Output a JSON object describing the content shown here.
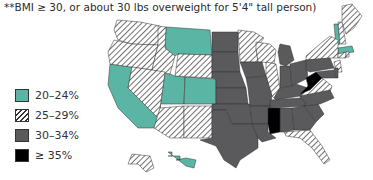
{
  "note": "**BMI ≥ 30, or about 30 lbs overweight for 5'4\" tall person)",
  "legend": [
    {
      "key": "teal",
      "label": "20–24%",
      "color": "#5bb5a5"
    },
    {
      "key": "hatch",
      "label": "25–29%",
      "color": "#ffffff"
    },
    {
      "key": "gray",
      "label": "30–34%",
      "color": "#5a5a5c"
    },
    {
      "key": "black",
      "label": "≥ 35%",
      "color": "#000000"
    }
  ],
  "colors": {
    "teal": "#5bb5a5",
    "gray": "#5a5a5c",
    "black": "#000000",
    "hatch": "#333333"
  },
  "chart_data": {
    "type": "choropleth",
    "title": "",
    "categories": [
      "20–24%",
      "25–29%",
      "30–34%",
      "≥ 35%"
    ],
    "states": {
      "teal": [
        "California",
        "Montana",
        "Utah",
        "Colorado",
        "Hawaii",
        "Vermont",
        "Massachusetts"
      ],
      "hatch": [
        "Washington",
        "Oregon",
        "Idaho",
        "Nevada",
        "Wyoming",
        "Arizona",
        "New Mexico",
        "Minnesota",
        "Wisconsin",
        "Illinois",
        "Maine",
        "New Hampshire",
        "New York",
        "Virginia",
        "Florida",
        "Connecticut",
        "New Jersey",
        "Rhode Island",
        "Alaska"
      ],
      "gray": [
        "North Dakota",
        "South Dakota",
        "Nebraska",
        "Kansas",
        "Oklahoma",
        "Texas",
        "Iowa",
        "Missouri",
        "Arkansas",
        "Louisiana",
        "Michigan",
        "Indiana",
        "Ohio",
        "Kentucky",
        "Tennessee",
        "Alabama",
        "Georgia",
        "South Carolina",
        "North Carolina",
        "Pennsylvania",
        "Delaware",
        "Maryland"
      ],
      "black": [
        "Mississippi",
        "West Virginia"
      ]
    }
  }
}
